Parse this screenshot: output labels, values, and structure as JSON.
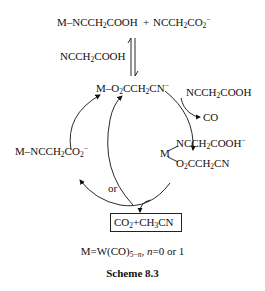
{
  "scheme": {
    "top_reactants": {
      "left": "M–NCCH₂COOH",
      "plus": "+",
      "right": "NCCH₂CO₂⁻"
    },
    "equilibrium_reagent": "NCCH₂COOH",
    "intermediate_1": "M–O₂CCH₂CN⁻",
    "reagent_in": "NCCH₂COOH",
    "byproduct_out": "CO",
    "intermediate_2": {
      "metal": "M",
      "ligand_top": "NCCH₂COOH⁻",
      "ligand_bottom": "O₂CCH₂CN"
    },
    "left_species": "M–NCCH₂CO₂⁻",
    "or_label": "or",
    "products": "CO₂+CH₃CN",
    "definition": "M=W(CO)5−n, n=0 or 1",
    "caption": "Scheme 8.3"
  }
}
